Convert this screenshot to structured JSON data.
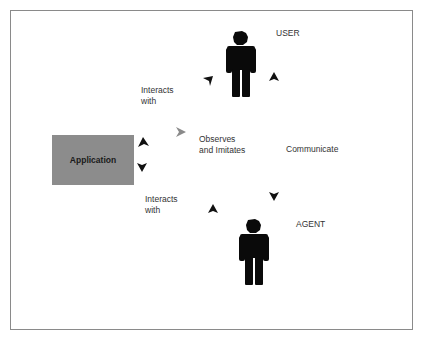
{
  "diagram": {
    "nodes": {
      "user": {
        "label": "USER"
      },
      "agent": {
        "label": "AGENT"
      },
      "application": {
        "label": "Application"
      }
    },
    "edges": {
      "user_app": {
        "label_line1": "Interacts",
        "label_line2": "with"
      },
      "agent_app": {
        "label_line1": "Interacts",
        "label_line2": "with"
      },
      "agent_observes_user": {
        "label_line1": "Observes",
        "label_line2": "and Imitates"
      },
      "user_agent": {
        "label": "Communicate"
      }
    },
    "colors": {
      "figure": "#0a0a0a",
      "arrow": "#111111",
      "observe_arrow": "#8a8a8a",
      "application_fill": "#8c8c8c",
      "frame_border": "#8a8a8a",
      "text": "#333333"
    }
  }
}
